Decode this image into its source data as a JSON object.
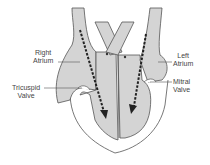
{
  "diagram": {
    "colors": {
      "fill": "#d4d4d4",
      "outline": "#555555",
      "arrow": "#222222",
      "background": "#ffffff"
    },
    "labels": {
      "right_atrium_line1": "Right",
      "right_atrium_line2": "Atrium",
      "left_atrium_line1": "Left",
      "left_atrium_line2": "Atrium",
      "tricuspid_line1": "Tricuspid",
      "tricuspid_line2": "Valve",
      "mitral_line1": "Mitral",
      "mitral_line2": "Valve"
    },
    "arrows": [
      {
        "name": "right-flow-arrow",
        "direction": "down",
        "side": "right-heart"
      },
      {
        "name": "left-flow-arrow",
        "direction": "down",
        "side": "left-heart"
      }
    ]
  }
}
